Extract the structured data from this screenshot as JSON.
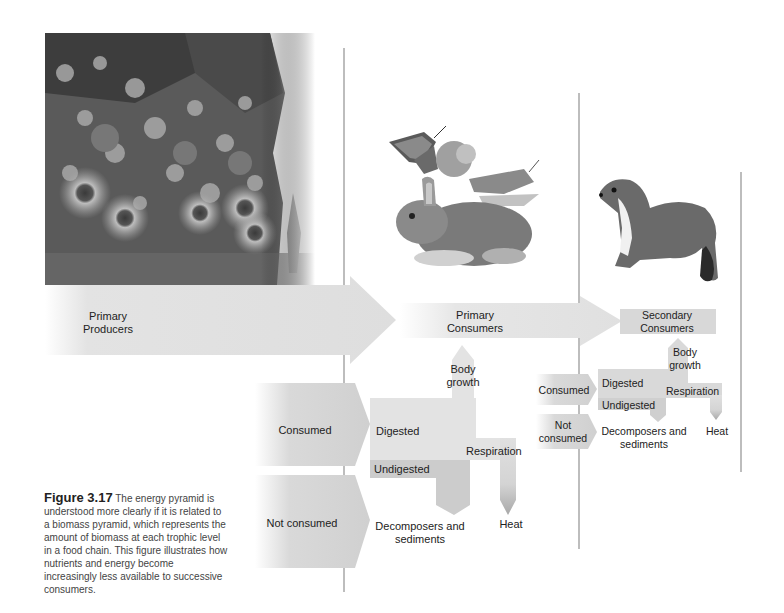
{
  "diagram": {
    "trophic_levels": [
      {
        "label_line1": "Primary",
        "label_line2": "Producers",
        "image": "flowers-plants-photo"
      },
      {
        "label_line1": "Primary",
        "label_line2": "Consumers",
        "image": "rabbit-butterfly-grasshopper-illustration"
      },
      {
        "label_line1": "Secondary",
        "label_line2": "Consumers",
        "image": "weasel-illustration"
      }
    ],
    "primary_flow": {
      "consumed": "Consumed",
      "not_consumed": "Not consumed",
      "digested": "Digested",
      "undigested": "Undigested",
      "body_growth_1": "Body",
      "body_growth_2": "growth",
      "respiration": "Respiration",
      "heat": "Heat",
      "decomposers_1": "Decomposers and",
      "decomposers_2": "sediments"
    },
    "secondary_flow": {
      "consumed": "Consumed",
      "not_consumed_1": "Not",
      "not_consumed_2": "consumed",
      "digested": "Digested",
      "undigested": "Undigested",
      "body_growth_1": "Body",
      "body_growth_2": "growth",
      "respiration": "Respiration",
      "heat": "Heat",
      "decomposers_1": "Decomposers and",
      "decomposers_2": "sediments"
    },
    "colors": {
      "arrow_light": "#e4e4e4",
      "arrow_mid": "#d6d6d6",
      "arrow_dark": "#c8c8c8",
      "divider": "#bdbdbd"
    }
  },
  "caption": {
    "figure_number": "Figure 3.17",
    "text": "The energy pyramid is understood more clearly if it is related to a biomass pyramid, which represents the amount of biomass at each trophic level in a food chain. This figure illustrates how nutrients and energy become increasingly less available to successive consumers."
  }
}
